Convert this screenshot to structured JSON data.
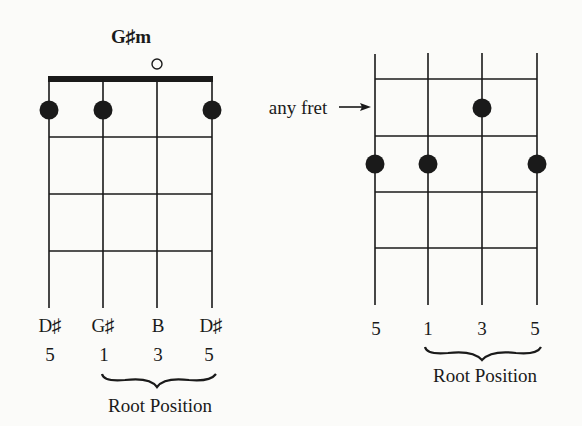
{
  "left_chart": {
    "title": "G♯m",
    "open_marker": "○",
    "note_names": [
      "D♯",
      "G♯",
      "B",
      "D♯"
    ],
    "intervals": [
      "5",
      "1",
      "3",
      "5"
    ],
    "bracket_label": "Root Position"
  },
  "right_chart": {
    "fret_pointer_label": "any fret",
    "arrow": "→",
    "intervals": [
      "5",
      "1",
      "3",
      "5"
    ],
    "bracket_label": "Root Position"
  }
}
